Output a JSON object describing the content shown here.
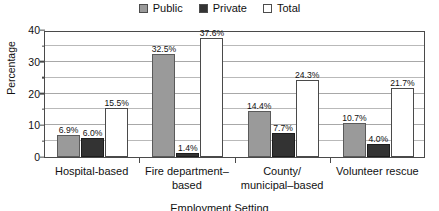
{
  "chart_data": {
    "type": "bar",
    "title": "",
    "xlabel": "Employment Setting",
    "ylabel": "Percentage",
    "ylim": [
      0,
      40
    ],
    "yticks": [
      0,
      10,
      20,
      30,
      40
    ],
    "minor_gridlines": [
      5,
      15,
      25,
      35
    ],
    "grid": true,
    "legend_position": "top-center",
    "categories": [
      "Hospital-based",
      "Fire department–based",
      "County/ municipal–based",
      "Volunteer rescue"
    ],
    "category_lines": [
      [
        "Hospital-based"
      ],
      [
        "Fire department–",
        "based"
      ],
      [
        "County/",
        "municipal–based"
      ],
      [
        "Volunteer rescue"
      ]
    ],
    "series": [
      {
        "name": "Public",
        "color": "#9a9a9a",
        "values": [
          6.9,
          32.5,
          14.4,
          10.7
        ],
        "labels": [
          "6.9%",
          "32.5%",
          "14.4%",
          "10.7%"
        ]
      },
      {
        "name": "Private",
        "color": "#333333",
        "values": [
          6.0,
          1.4,
          7.7,
          4.0
        ],
        "labels": [
          "6.0%",
          "1.4%",
          "7.7%",
          "4.0%"
        ]
      },
      {
        "name": "Total",
        "color": "#ffffff",
        "values": [
          15.5,
          37.6,
          24.3,
          21.7
        ],
        "labels": [
          "15.5%",
          "37.6%",
          "24.3%",
          "21.7%"
        ]
      }
    ]
  },
  "legend": {
    "entries": [
      {
        "label": "Public"
      },
      {
        "label": "Private"
      },
      {
        "label": "Total"
      }
    ]
  },
  "axes": {
    "y_title": "Percentage",
    "x_title": "Employment Setting",
    "y_tick_labels": [
      "0",
      "10",
      "20",
      "30",
      "40"
    ]
  }
}
